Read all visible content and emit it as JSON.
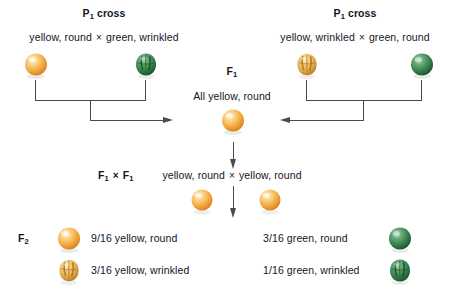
{
  "diagram": {
    "background_color": "#ffffff",
    "text_color": "#14141f",
    "line_color": "#4a4a52",
    "multiply_symbol": "×"
  },
  "left_cross": {
    "heading": "P",
    "heading_sub": "1",
    "heading_suffix": "cross",
    "parents_label_a": "yellow, round",
    "parents_label_b": "green, wrinkled",
    "parent_a_phenotype": "yellow-round-pea",
    "parent_b_phenotype": "green-wrinkled-pea"
  },
  "right_cross": {
    "heading": "P",
    "heading_sub": "1",
    "heading_suffix": "cross",
    "parents_label_a": "yellow, wrinkled",
    "parents_label_b": "green, round",
    "parent_a_phenotype": "yellow-wrinkled-pea",
    "parent_b_phenotype": "green-round-pea"
  },
  "f1": {
    "label": "F",
    "label_sub": "1",
    "result_text": "All yellow, round",
    "phenotype": "yellow-round-pea"
  },
  "f1_cross": {
    "label_a": "F",
    "label_a_sub": "1",
    "label_b": "F",
    "label_b_sub": "1",
    "gamete_a": "yellow, round",
    "gamete_b": "yellow, round"
  },
  "f2": {
    "label": "F",
    "label_sub": "2",
    "rows": [
      {
        "ratio_text": "9/16 yellow, round",
        "phenotype": "yellow-round-pea",
        "side": "left"
      },
      {
        "ratio_text": "3/16 yellow, wrinkled",
        "phenotype": "yellow-wrinkled-pea",
        "side": "left"
      },
      {
        "ratio_text": "3/16 green, round",
        "phenotype": "green-round-pea",
        "side": "right"
      },
      {
        "ratio_text": "1/16 green, wrinkled",
        "phenotype": "green-wrinkled-pea",
        "side": "right"
      }
    ]
  },
  "colors": {
    "yellow_round_light": "#fde9c0",
    "yellow_round_mid": "#f6b555",
    "yellow_round_dark": "#e8952b",
    "yellow_wrinkled_light": "#f7dda2",
    "yellow_wrinkled_mid": "#e0a845",
    "yellow_wrinkled_dark": "#b87a20",
    "green_round_light": "#8fc49c",
    "green_round_mid": "#3d8a52",
    "green_round_dark": "#1e5c33",
    "green_wrinkled_light": "#7db98d",
    "green_wrinkled_mid": "#2f7a46",
    "green_wrinkled_dark": "#14512a"
  }
}
